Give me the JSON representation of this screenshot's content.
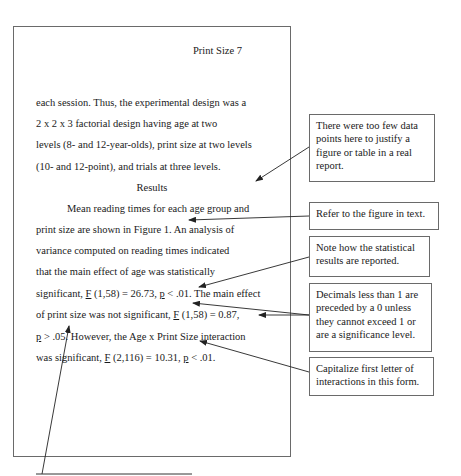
{
  "page": {
    "running_head": "Print Size  7",
    "lines": [
      "each session.  Thus, the experimental design was a",
      "2  x  2  x  3 factorial design having age at two",
      "levels (8- and 12-year-olds), print size at two levels",
      "(10- and 12-point), and trials at three levels."
    ],
    "section_heading": "Results",
    "results": {
      "l1": "Mean reading times for each age group and",
      "l2": "print size are shown in Figure 1.  An analysis of",
      "l3": "variance computed on reading times indicated",
      "l4": "that the main effect of age was statistically",
      "l5_a": "significant, ",
      "l5_F": "F",
      "l5_b": " (1,58) = 26.73, ",
      "l5_p": "p",
      "l5_c": " < .01.  The main effect",
      "l6_a": "of print size was not significant, ",
      "l6_F": "F",
      "l6_b": " (1,58) = 0.87,",
      "l7_p": "p",
      "l7_a": " > .05.  However, the Age x Print Size interaction",
      "l8_a": "was significant, ",
      "l8_F": "F",
      "l8_b": " (2,116) = 10.31, ",
      "l8_p": "p",
      "l8_c": " < .01."
    }
  },
  "annotations": [
    {
      "text": "There were too few data points here to justify a figure or table in a real report."
    },
    {
      "text": "Refer to the figure in text."
    },
    {
      "text": "Note how the statistical results are reported."
    },
    {
      "text": "Decimals less than 1 are preceded by a 0 unless they cannot exceed 1 or are a significance level."
    },
    {
      "text": "Capitalize first letter of interactions in this form."
    }
  ],
  "colors": {
    "border": "#6a6a6a",
    "text": "#1a1a1a",
    "arrow": "#222222"
  }
}
